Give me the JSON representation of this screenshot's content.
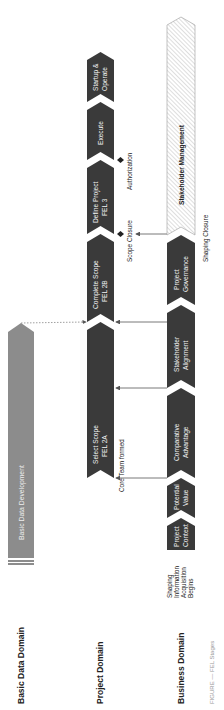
{
  "domains": {
    "basic_data": "Basic Data Domain",
    "project": "Project Domain",
    "business": "Business Domain"
  },
  "basic_data_bar": {
    "label": "Basic Data Development",
    "color": "#8c8c8c"
  },
  "project_stages": [
    {
      "line1": "Select Scope",
      "line2": "FEL 2A"
    },
    {
      "line1": "Complete Scope",
      "line2": "FEL 2B"
    },
    {
      "line1": "Define Project",
      "line2": "FEL 3"
    },
    {
      "line1": "Execute",
      "line2": ""
    },
    {
      "line1": "Startup &",
      "line2": "Operate"
    }
  ],
  "business_stages": [
    {
      "line1": "Project",
      "line2": "Context"
    },
    {
      "line1": "Potential",
      "line2": "Value"
    },
    {
      "line1": "Comparative",
      "line2": "Advantage"
    },
    {
      "line1": "Stakeholder",
      "line2": "Alignment"
    },
    {
      "line1": "Project",
      "line2": "Governance"
    }
  ],
  "stakeholder_management": "Stakeholder Management",
  "milestones": {
    "core_team": "Core Team formed",
    "scope_closure": "Scope Closure",
    "authorization": "Authorization",
    "shaping_closure": "Shaping Closure",
    "shaping_begins": [
      "Shaping",
      "Information",
      "Acquisition",
      "Begins"
    ]
  },
  "caption": "FIGURE — FEL Stages",
  "colors": {
    "dark_stage": "#3a3a3a",
    "gray_bar": "#8c8c8c",
    "hatch": "#bdbdbd",
    "line": "#555555"
  }
}
